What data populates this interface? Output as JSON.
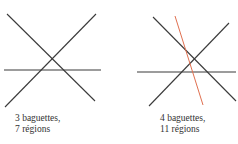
{
  "figures": [
    {
      "caption_line1": "3 baguettes,",
      "caption_line2": "7 régions",
      "lines": [
        {
          "x1": 7,
          "y1": 14,
          "x2": 95,
          "y2": 101,
          "color": "#3a3a3a"
        },
        {
          "x1": 96,
          "y1": 14,
          "x2": 5,
          "y2": 107,
          "color": "#3a3a3a"
        },
        {
          "x1": 4,
          "y1": 70,
          "x2": 101,
          "y2": 70,
          "color": "#3a3a3a"
        }
      ]
    },
    {
      "caption_line1": "4 baguettes,",
      "caption_line2": "11 régions",
      "lines": [
        {
          "x1": 153,
          "y1": 17,
          "x2": 236,
          "y2": 101,
          "color": "#3a3a3a"
        },
        {
          "x1": 229,
          "y1": 23,
          "x2": 149,
          "y2": 106,
          "color": "#3a3a3a"
        },
        {
          "x1": 137,
          "y1": 72,
          "x2": 236,
          "y2": 72,
          "color": "#3a3a3a"
        },
        {
          "x1": 175,
          "y1": 16,
          "x2": 203,
          "y2": 105,
          "color": "#e07050"
        }
      ]
    }
  ],
  "colors": {
    "stroke": "#3a3a3a",
    "highlight": "#e07050",
    "text": "#333333"
  }
}
